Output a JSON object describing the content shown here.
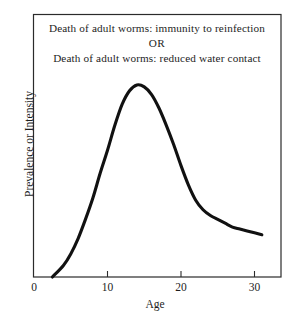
{
  "chart_data": {
    "type": "line",
    "title": "",
    "subtitle": "",
    "xlabel": "Age",
    "ylabel": "Prevalence or Intensity",
    "xlim": [
      0,
      33
    ],
    "ylim": [
      0,
      1.08
    ],
    "xticks": [
      0,
      10,
      20,
      30
    ],
    "xticklabels": [
      "0",
      "10",
      "20",
      "30"
    ],
    "yticks": [],
    "yticklabels": [],
    "grid": false,
    "legend": null,
    "series": [
      {
        "name": "Age-prevalence / intensity profile",
        "color": "#111111",
        "x": [
          2.5,
          4,
          5,
          6,
          7,
          8,
          9,
          10,
          11,
          12,
          13,
          14,
          15,
          16,
          17,
          18,
          19,
          20,
          21,
          22,
          23,
          24,
          25,
          26,
          27,
          28,
          29,
          30,
          31
        ],
        "y": [
          0.0,
          0.06,
          0.12,
          0.2,
          0.3,
          0.41,
          0.54,
          0.66,
          0.79,
          0.9,
          0.97,
          1.0,
          0.99,
          0.95,
          0.88,
          0.79,
          0.69,
          0.58,
          0.48,
          0.4,
          0.35,
          0.32,
          0.3,
          0.28,
          0.26,
          0.25,
          0.24,
          0.23,
          0.22
        ]
      }
    ],
    "annotations": [
      {
        "id": "annotation-line-1",
        "text": "Death of adult worms:  immunity to reinfection"
      },
      {
        "id": "annotation-line-2",
        "text": "OR"
      },
      {
        "id": "annotation-line-3",
        "text": "Death of adult worms:  reduced water contact"
      }
    ],
    "axes_style": {
      "frame": "full-box",
      "frame_color": "#2b2b2b",
      "curve_width": 3.1
    }
  }
}
